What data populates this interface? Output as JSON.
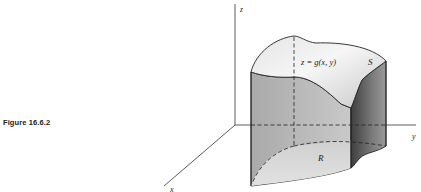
{
  "figure": {
    "caption": "Figure 16.6.2",
    "axes": {
      "z_label": "z",
      "y_label": "y",
      "x_label": "x"
    },
    "surface_label": "S",
    "surface_equation": "z = g(x, y)",
    "region_label": "R",
    "colors": {
      "line": "#222222",
      "top_surface_light": "#f2f2f2",
      "top_surface_shade": "#cfcfcf",
      "front_wall": "#b8b8b8",
      "right_wall_dark": "#6a6a6a",
      "base_region": "#d8d8d8"
    }
  }
}
